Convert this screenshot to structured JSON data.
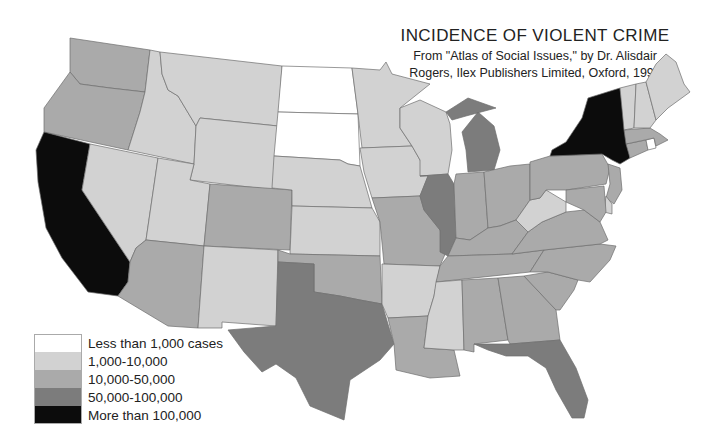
{
  "header": {
    "title": "INCIDENCE OF VIOLENT CRIME",
    "subtitle_line1": "From \"Atlas of Social Issues,\" by Dr. Alisdair",
    "subtitle_line2": "Rogers, Ilex Publishers Limited, Oxford, 1990"
  },
  "legend": {
    "items": [
      {
        "label": "Less than 1,000 cases",
        "color": "#ffffff"
      },
      {
        "label": "1,000-10,000",
        "color": "#d2d2d2"
      },
      {
        "label": "10,000-50,000",
        "color": "#aaaaaa"
      },
      {
        "label": "50,000-100,000",
        "color": "#7c7c7c"
      },
      {
        "label": "More than 100,000",
        "color": "#0c0c0c"
      }
    ]
  },
  "map": {
    "classes": {
      "lt1k": "#ffffff",
      "k1_10": "#d2d2d2",
      "k10_50": "#aaaaaa",
      "k50_100": "#7c7c7c",
      "gt100k": "#0c0c0c"
    },
    "states": {
      "WA": "k10_50",
      "OR": "k10_50",
      "CA": "gt100k",
      "ID": "k1_10",
      "NV": "k1_10",
      "MT": "k1_10",
      "WY": "k1_10",
      "UT": "k1_10",
      "AZ": "k10_50",
      "CO": "k10_50",
      "NM": "k1_10",
      "ND": "lt1k",
      "SD": "lt1k",
      "NE": "k1_10",
      "KS": "k1_10",
      "OK": "k10_50",
      "TX": "k50_100",
      "MN": "k1_10",
      "IA": "k1_10",
      "MO": "k10_50",
      "AR": "k1_10",
      "LA": "k10_50",
      "WI": "k1_10",
      "IL": "k50_100",
      "MI": "k50_100",
      "IN": "k10_50",
      "OH": "k10_50",
      "KY": "k10_50",
      "TN": "k10_50",
      "MS": "k1_10",
      "AL": "k10_50",
      "GA": "k10_50",
      "FL": "k50_100",
      "SC": "k10_50",
      "NC": "k10_50",
      "VA": "k10_50",
      "WV": "k1_10",
      "PA": "k10_50",
      "NY": "gt100k",
      "NJ": "k10_50",
      "DE": "k1_10",
      "MD": "k10_50",
      "CT": "k10_50",
      "RI": "lt1k",
      "MA": "k10_50",
      "VT": "k1_10",
      "NH": "k1_10",
      "ME": "k1_10"
    }
  }
}
